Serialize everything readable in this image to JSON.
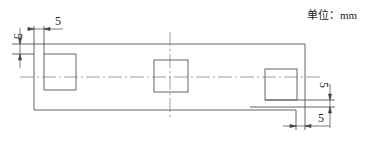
{
  "unit_label": "单位：mm",
  "dimensions": {
    "top_left_horizontal": "5",
    "top_left_vertical": "5",
    "bottom_right_vertical": "5",
    "bottom_right_horizontal": "5"
  },
  "colors": {
    "line": "#555555",
    "text": "#222222"
  }
}
